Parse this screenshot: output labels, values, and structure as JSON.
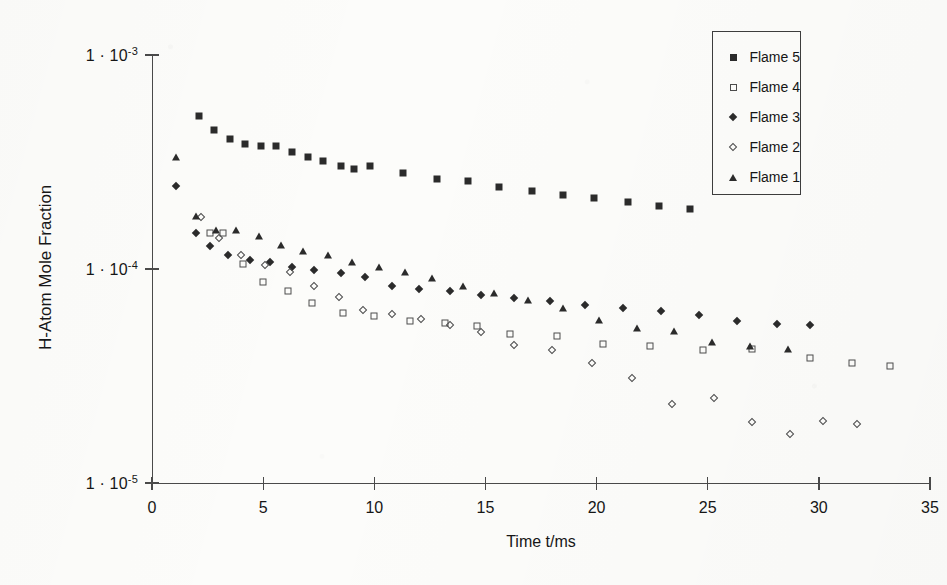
{
  "chart_data": {
    "type": "scatter",
    "title": "",
    "xlabel": "Time t/ms",
    "ylabel": "H-Atom Mole Fraction",
    "xlim": [
      0,
      35
    ],
    "ylim": [
      1e-05,
      0.001
    ],
    "yscale": "log",
    "xscale": "linear",
    "grid": false,
    "legend_position": "top-right",
    "xticks": [
      0,
      5,
      10,
      15,
      20,
      25,
      30,
      35
    ],
    "xtick_labels": [
      "0",
      "5",
      "10",
      "15",
      "20",
      "25",
      "30",
      "35"
    ],
    "yticks": [
      0.001,
      0.0001,
      1e-05
    ],
    "ytick_labels": [
      "1 · 10-3",
      "1 · 10-4",
      "1 · 10-5"
    ],
    "ytick_mantissa": [
      "1 · 10",
      "1 · 10",
      "1 · 10"
    ],
    "ytick_exponent": [
      "-3",
      "-4",
      "-5"
    ],
    "series": [
      {
        "name": "Flame 5",
        "marker": "filled-square",
        "color": "#2b2b2b",
        "points": [
          [
            2.1,
            0.00052
          ],
          [
            2.8,
            0.000445
          ],
          [
            3.5,
            0.000405
          ],
          [
            4.2,
            0.000385
          ],
          [
            4.9,
            0.000375
          ],
          [
            5.6,
            0.000375
          ],
          [
            6.3,
            0.000352
          ],
          [
            7.0,
            0.000332
          ],
          [
            7.7,
            0.00032
          ],
          [
            8.5,
            0.000302
          ],
          [
            9.1,
            0.000294
          ],
          [
            9.8,
            0.000302
          ],
          [
            11.3,
            0.000282
          ],
          [
            12.8,
            0.000262
          ],
          [
            14.2,
            0.000258
          ],
          [
            15.6,
            0.000242
          ],
          [
            17.1,
            0.000232
          ],
          [
            18.5,
            0.000222
          ],
          [
            19.9,
            0.000214
          ],
          [
            21.4,
            0.000205
          ],
          [
            22.8,
            0.000196
          ],
          [
            24.2,
            0.00019
          ]
        ]
      },
      {
        "name": "Flame 4",
        "marker": "open-square",
        "color": "#4c4c4c",
        "points": [
          [
            2.6,
            0.000147
          ],
          [
            3.2,
            0.000147
          ],
          [
            4.1,
            0.000106
          ],
          [
            5.0,
            8.65e-05
          ],
          [
            6.1,
            7.9e-05
          ],
          [
            7.2,
            6.95e-05
          ],
          [
            8.6,
            6.2e-05
          ],
          [
            10.0,
            6e-05
          ],
          [
            11.6,
            5.7e-05
          ],
          [
            13.2,
            5.6e-05
          ],
          [
            14.6,
            5.4e-05
          ],
          [
            16.1,
            4.95e-05
          ],
          [
            18.2,
            4.85e-05
          ],
          [
            20.3,
            4.45e-05
          ],
          [
            22.4,
            4.35e-05
          ],
          [
            24.8,
            4.2e-05
          ],
          [
            27.0,
            4.25e-05
          ],
          [
            29.6,
            3.85e-05
          ],
          [
            31.5,
            3.65e-05
          ],
          [
            33.2,
            3.52e-05
          ]
        ]
      },
      {
        "name": "Flame 3",
        "marker": "filled-diamond",
        "color": "#2b2b2b",
        "points": [
          [
            1.1,
            0.000245
          ],
          [
            2.0,
            0.000147
          ],
          [
            2.6,
            0.000128
          ],
          [
            3.4,
            0.000116
          ],
          [
            4.4,
            0.00011
          ],
          [
            5.3,
            0.000108
          ],
          [
            6.3,
            0.000102
          ],
          [
            7.3,
            9.85e-05
          ],
          [
            8.5,
            9.55e-05
          ],
          [
            9.6,
            9.2e-05
          ],
          [
            10.8,
            8.35e-05
          ],
          [
            12.0,
            8.1e-05
          ],
          [
            13.4,
            7.9e-05
          ],
          [
            14.8,
            7.55e-05
          ],
          [
            16.3,
            7.3e-05
          ],
          [
            17.9,
            7.05e-05
          ],
          [
            19.5,
            6.8e-05
          ],
          [
            21.2,
            6.55e-05
          ],
          [
            22.9,
            6.35e-05
          ],
          [
            24.6,
            6.1e-05
          ],
          [
            26.3,
            5.7e-05
          ],
          [
            28.1,
            5.55e-05
          ],
          [
            29.6,
            5.5e-05
          ]
        ]
      },
      {
        "name": "Flame 2",
        "marker": "open-diamond",
        "color": "#4c4c4c",
        "points": [
          [
            2.2,
            0.000175
          ],
          [
            3.0,
            0.00014
          ],
          [
            4.0,
            0.000116
          ],
          [
            5.1,
            0.000104
          ],
          [
            6.2,
            9.7e-05
          ],
          [
            7.3,
            8.3e-05
          ],
          [
            8.4,
            7.4e-05
          ],
          [
            9.5,
            6.4e-05
          ],
          [
            10.8,
            6.15e-05
          ],
          [
            12.1,
            5.85e-05
          ],
          [
            13.4,
            5.45e-05
          ],
          [
            14.8,
            5.1e-05
          ],
          [
            16.3,
            4.4e-05
          ],
          [
            18.0,
            4.2e-05
          ],
          [
            19.8,
            3.65e-05
          ],
          [
            21.6,
            3.1e-05
          ],
          [
            23.4,
            2.35e-05
          ],
          [
            25.3,
            2.5e-05
          ],
          [
            27.0,
            1.92e-05
          ],
          [
            28.7,
            1.7e-05
          ],
          [
            30.2,
            1.95e-05
          ],
          [
            31.7,
            1.88e-05
          ]
        ]
      },
      {
        "name": "Flame 1",
        "marker": "filled-triangle",
        "color": "#2b2b2b",
        "points": [
          [
            1.1,
            0.000335
          ],
          [
            2.0,
            0.000177
          ],
          [
            2.9,
            0.000152
          ],
          [
            3.8,
            0.000152
          ],
          [
            4.8,
            0.000142
          ],
          [
            5.8,
            0.00013
          ],
          [
            6.8,
            0.000122
          ],
          [
            7.9,
            0.000116
          ],
          [
            9.0,
            0.000108
          ],
          [
            10.2,
            0.000102
          ],
          [
            11.4,
            9.7e-05
          ],
          [
            12.6,
            9.1e-05
          ],
          [
            14.0,
            8.3e-05
          ],
          [
            15.4,
            7.7e-05
          ],
          [
            16.9,
            7.15e-05
          ],
          [
            18.5,
            6.55e-05
          ],
          [
            20.1,
            5.8e-05
          ],
          [
            21.8,
            5.3e-05
          ],
          [
            23.5,
            5.15e-05
          ],
          [
            25.2,
            4.55e-05
          ],
          [
            26.9,
            4.35e-05
          ],
          [
            28.6,
            4.25e-05
          ]
        ]
      }
    ]
  },
  "legend": {
    "items": [
      {
        "label": "Flame 5",
        "marker": "filled-square"
      },
      {
        "label": "Flame 4",
        "marker": "open-square"
      },
      {
        "label": "Flame 3",
        "marker": "filled-diamond"
      },
      {
        "label": "Flame 2",
        "marker": "open-diamond"
      },
      {
        "label": "Flame 1",
        "marker": "filled-triangle"
      }
    ]
  }
}
